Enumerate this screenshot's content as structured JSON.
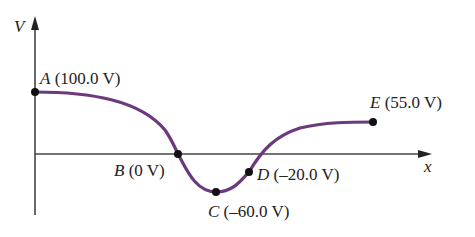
{
  "diagram": {
    "axes": {
      "y_label": "V",
      "x_label": "x"
    },
    "curve_color": "#6b3a7d",
    "points": [
      {
        "letter": "A",
        "value": "(100.0 V)"
      },
      {
        "letter": "B",
        "value": "(0 V)"
      },
      {
        "letter": "C",
        "value": "(–60.0 V)"
      },
      {
        "letter": "D",
        "value": "(–20.0 V)"
      },
      {
        "letter": "E",
        "value": "(55.0 V)"
      }
    ]
  }
}
